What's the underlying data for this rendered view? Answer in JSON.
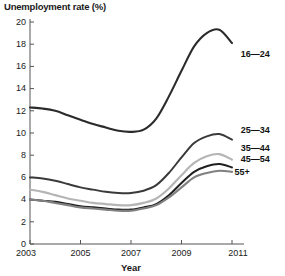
{
  "chart_data": {
    "type": "line",
    "title": "Unemployment rate (%)",
    "xlabel": "Year",
    "ylabel": "",
    "xlim": [
      2003,
      2011
    ],
    "ylim": [
      0,
      20
    ],
    "grid": false,
    "legend_position": "right-inline-labels",
    "xticks": [
      "2003",
      "2005",
      "2007",
      "2009",
      "2011"
    ],
    "xtick_values": [
      2003,
      2005,
      2007,
      2009,
      2011
    ],
    "yticks": [
      "0",
      "2",
      "4",
      "6",
      "8",
      "10",
      "12",
      "14",
      "16",
      "18",
      "20"
    ],
    "ytick_values": [
      0,
      2,
      4,
      6,
      8,
      10,
      12,
      14,
      16,
      18,
      20
    ],
    "x": [
      2003,
      2003.5,
      2004,
      2004.5,
      2005,
      2005.5,
      2006,
      2006.5,
      2007,
      2007.5,
      2008,
      2008.5,
      2009,
      2009.5,
      2010,
      2010.5,
      2011
    ],
    "series": [
      {
        "name": "16—24",
        "label": "16—24",
        "color": "#2b2b2b",
        "width": 2.1,
        "label_x": 2011.35,
        "label_y": 17.1,
        "values": [
          12.3,
          12.2,
          12.0,
          11.6,
          11.2,
          10.8,
          10.5,
          10.2,
          10.1,
          10.3,
          11.3,
          13.3,
          15.6,
          17.8,
          19.0,
          19.3,
          18.1
        ]
      },
      {
        "name": "25—34",
        "label": "25—34",
        "color": "#3a3a3a",
        "width": 2.0,
        "label_x": 2011.35,
        "label_y": 10.2,
        "values": [
          6.0,
          5.9,
          5.7,
          5.4,
          5.1,
          4.9,
          4.7,
          4.6,
          4.6,
          4.8,
          5.3,
          6.4,
          7.8,
          9.1,
          9.7,
          9.9,
          9.4
        ]
      },
      {
        "name": "35—44",
        "label": "35—44",
        "color": "#b5b5b5",
        "width": 2.2,
        "label_x": 2011.35,
        "label_y": 8.6,
        "values": [
          4.9,
          4.7,
          4.4,
          4.1,
          3.9,
          3.7,
          3.6,
          3.5,
          3.5,
          3.7,
          4.1,
          5.0,
          6.2,
          7.3,
          7.9,
          8.1,
          7.6
        ]
      },
      {
        "name": "45—54",
        "label": "45—54",
        "color": "#1f1f1f",
        "width": 2.0,
        "label_x": 2011.35,
        "label_y": 7.6,
        "values": [
          4.0,
          3.9,
          3.8,
          3.6,
          3.4,
          3.3,
          3.2,
          3.1,
          3.1,
          3.3,
          3.6,
          4.4,
          5.5,
          6.5,
          7.0,
          7.2,
          6.9
        ]
      },
      {
        "name": "55+",
        "label": "55+",
        "color": "#808080",
        "width": 2.1,
        "label_x": 2011.1,
        "label_y": 6.4,
        "values": [
          4.0,
          3.9,
          3.7,
          3.5,
          3.3,
          3.2,
          3.1,
          3.0,
          3.0,
          3.2,
          3.5,
          4.2,
          5.1,
          6.0,
          6.4,
          6.6,
          6.5
        ]
      }
    ]
  },
  "colors": {
    "axis": "#555555",
    "text": "#1a1a1a",
    "background": "#ffffff"
  }
}
